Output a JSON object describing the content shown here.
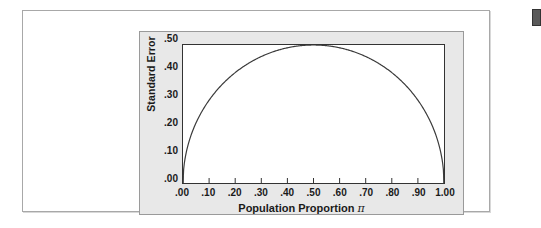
{
  "figure": {
    "panel_background": "#e8e8e8",
    "plot_background": "#ffffff",
    "frame_color": "#a8a8a8",
    "curve_color": "#3a3a3a"
  },
  "edge_tab": {
    "name": "page-edge-tab",
    "color": "#5a5a5a"
  },
  "chart_data": {
    "type": "line",
    "title": "",
    "subtitle": "",
    "xlabel": "Population Proportion π",
    "xlabel_text": "Population Proportion",
    "xlabel_symbol": "π",
    "ylabel": "Standard Error",
    "xlim": [
      0.0,
      1.0
    ],
    "ylim": [
      0.0,
      0.5
    ],
    "grid": false,
    "legend": "none",
    "x_tick_labels": [
      ".00",
      ".10",
      ".20",
      ".30",
      ".40",
      ".50",
      ".60",
      ".70",
      ".80",
      ".90",
      "1.00"
    ],
    "x_tick_values": [
      0.0,
      0.1,
      0.2,
      0.3,
      0.4,
      0.5,
      0.6,
      0.7,
      0.8,
      0.9,
      1.0
    ],
    "y_tick_labels": [
      ".00",
      ".10",
      ".20",
      ".30",
      ".40",
      ".50"
    ],
    "y_tick_values": [
      0.0,
      0.1,
      0.2,
      0.3,
      0.4,
      0.5
    ],
    "series": [
      {
        "name": "Standard Error",
        "x": [
          0.0,
          0.01,
          0.02,
          0.03,
          0.04,
          0.05,
          0.06,
          0.08,
          0.1,
          0.12,
          0.15,
          0.18,
          0.2,
          0.25,
          0.3,
          0.35,
          0.4,
          0.45,
          0.5,
          0.55,
          0.6,
          0.65,
          0.7,
          0.75,
          0.8,
          0.82,
          0.85,
          0.88,
          0.9,
          0.92,
          0.94,
          0.95,
          0.96,
          0.97,
          0.98,
          0.99,
          1.0
        ],
        "y": [
          0.0,
          0.099,
          0.14,
          0.171,
          0.196,
          0.218,
          0.237,
          0.271,
          0.3,
          0.325,
          0.357,
          0.384,
          0.4,
          0.433,
          0.458,
          0.477,
          0.49,
          0.497,
          0.5,
          0.497,
          0.49,
          0.477,
          0.458,
          0.433,
          0.4,
          0.384,
          0.357,
          0.325,
          0.3,
          0.271,
          0.237,
          0.218,
          0.196,
          0.171,
          0.14,
          0.099,
          0.0
        ]
      }
    ],
    "peak": {
      "x": 0.5,
      "y": 0.5
    },
    "formula_description": "Standard error of a proportion, maximum at pi = .50"
  }
}
